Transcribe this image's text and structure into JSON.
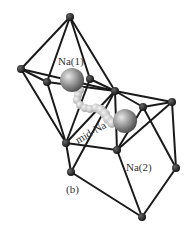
{
  "figure": {
    "panel_label": "(b)",
    "labels": {
      "na1": "Na(1)",
      "na2": "Na(2)",
      "mid": "mid-Na"
    },
    "colors": {
      "edge": "#1a1a1a",
      "node": "#1a1a1a",
      "sphere": "#8a8a8a",
      "path": "#c8c8c8"
    }
  }
}
